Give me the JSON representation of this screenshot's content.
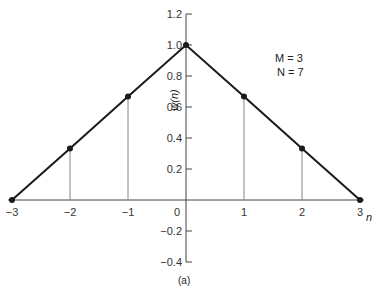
{
  "chart_data": {
    "type": "line",
    "title": "",
    "caption": "(a)",
    "xlabel": "n",
    "ylabel": "w(n)",
    "x": [
      -3,
      -2,
      -1,
      0,
      1,
      2,
      3
    ],
    "values": [
      0.0,
      0.333,
      0.667,
      1.0,
      0.667,
      0.333,
      0.0
    ],
    "xlim": [
      -3,
      3
    ],
    "ylim": [
      -0.4,
      1.2
    ],
    "xticks": [
      "-3",
      "-2",
      "-1",
      "0",
      "1",
      "2",
      "3"
    ],
    "yticks": [
      "1.2",
      "1.0",
      "0.8",
      "0.6",
      "0.4",
      "0.2",
      "-0.2",
      "-0.4"
    ],
    "grid": false,
    "stems": true,
    "annotations": [
      "M = 3",
      "N = 7"
    ],
    "colors": {
      "line": "#1a1a1a",
      "axis": "#444444",
      "stem": "#888888"
    }
  },
  "labels": {
    "m_text": "M = 3",
    "n_text": "N = 7",
    "x_axis": "n",
    "y_axis": "w(n)",
    "caption": "(a)"
  }
}
